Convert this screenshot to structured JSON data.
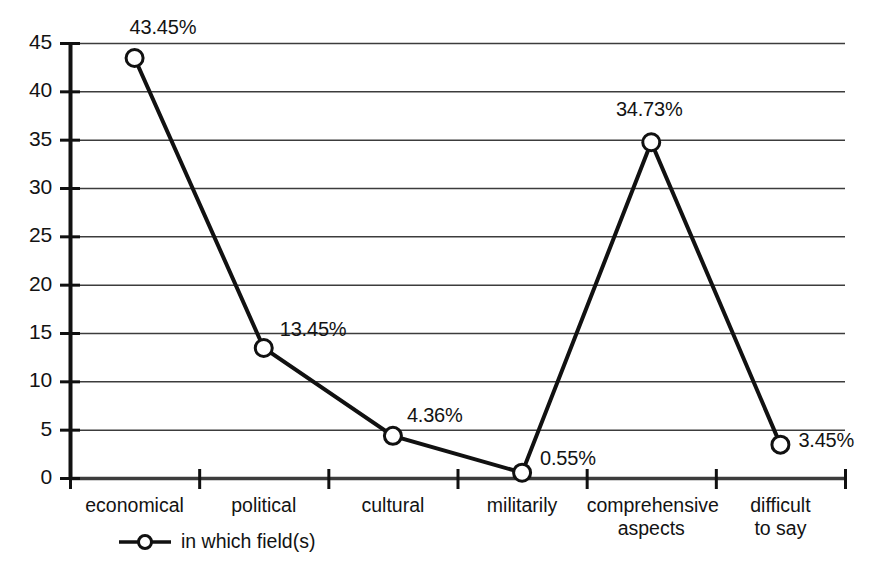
{
  "chart_data": {
    "type": "line",
    "title": "",
    "xlabel": "",
    "ylabel": "",
    "categories": [
      "economical",
      "political",
      "cultural",
      "militarily",
      "comprehensive\naspects",
      "difficult\nto say"
    ],
    "values": [
      43.45,
      13.45,
      4.36,
      0.55,
      34.73,
      3.45
    ],
    "data_labels": [
      "43.45%",
      "13.45%",
      "4.36%",
      "0.55%",
      "34.73%",
      "3.45%"
    ],
    "series": [
      {
        "name": "in which field(s)",
        "values": [
          43.45,
          13.45,
          4.36,
          0.55,
          34.73,
          3.45
        ]
      }
    ],
    "ylim": [
      0,
      45
    ],
    "yticks": [
      0,
      5,
      10,
      15,
      20,
      25,
      30,
      35,
      40,
      45
    ],
    "ytick_labels": [
      "0",
      "5",
      "10",
      "15",
      "20",
      "25",
      "30",
      "35",
      "40",
      "45"
    ],
    "grid": true,
    "legend_position": "bottom-left",
    "marker": "open-circle",
    "line_color": "#111111",
    "marker_fill": "#ffffff",
    "grid_color": "#3c3c3c"
  },
  "legend": {
    "label": "in which field(s)",
    "marker_icon": "line-circle-marker-icon"
  },
  "axes": {
    "y_axis_name": "value-axis",
    "x_axis_name": "category-axis"
  }
}
